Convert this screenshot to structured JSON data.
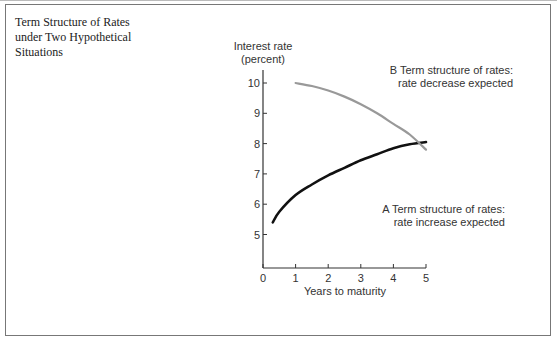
{
  "figure": {
    "title_lines": [
      "Term Structure of Rates",
      "under Two Hypothetical",
      "Situations"
    ]
  },
  "chart_data": {
    "type": "line",
    "title": "Term Structure of Rates under Two Hypothetical Situations",
    "xlabel": "Years to maturity",
    "ylabel_lines": [
      "Interest rate",
      "(percent)"
    ],
    "ylabel": "Interest rate (percent)",
    "xlim": [
      0,
      5
    ],
    "ylim": [
      4,
      10.5
    ],
    "x_ticks": [
      "0",
      "1",
      "2",
      "3",
      "4",
      "5"
    ],
    "y_ticks": [
      "5",
      "6",
      "7",
      "8",
      "9",
      "10"
    ],
    "grid": false,
    "legend": "inline annotations",
    "series": [
      {
        "name": "A Term structure of rates: rate increase expected",
        "label_lines": [
          "A Term structure of rates:",
          "rate increase expected"
        ],
        "color": "#111111",
        "x": [
          0.3,
          0.5,
          1.0,
          1.5,
          2.0,
          2.5,
          3.0,
          3.5,
          4.0,
          4.5,
          5.0
        ],
        "y": [
          5.4,
          5.75,
          6.3,
          6.65,
          6.95,
          7.2,
          7.45,
          7.65,
          7.85,
          7.98,
          8.05
        ]
      },
      {
        "name": "B Term structure of rates: rate decrease expected",
        "label_lines": [
          "B Term structure of rates:",
          "rate decrease expected"
        ],
        "color": "#999999",
        "x": [
          1.0,
          1.5,
          2.0,
          2.5,
          3.0,
          3.5,
          4.0,
          4.5,
          5.0
        ],
        "y": [
          10.0,
          9.9,
          9.75,
          9.55,
          9.3,
          9.0,
          8.65,
          8.3,
          7.8
        ]
      }
    ]
  }
}
